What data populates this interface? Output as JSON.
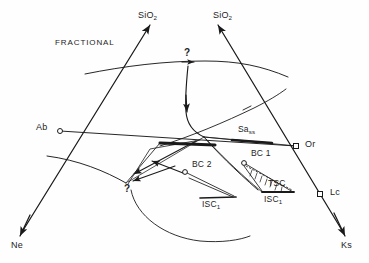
{
  "figure": {
    "type": "petrologic-phase-diagram",
    "mode_label": "FRACTIONAL",
    "ink_color": "#1a1a1a",
    "background": "#ffffff"
  },
  "apex_labels": {
    "sio2_left": "SiO",
    "sio2_left_sub": "2",
    "sio2_right": "SiO",
    "sio2_right_sub": "2",
    "ne": "Ne",
    "ks": "Ks"
  },
  "node_labels": {
    "ab": "Ab",
    "or": "Or",
    "lc": "Lc"
  },
  "field_labels": {
    "sa_ss": "Sa",
    "sa_ss_sub": "ss",
    "bc1": "BC 1",
    "bc2": "BC 2",
    "tsc": "TSC",
    "isc1_left": "ISC",
    "isc1_left_sub": "1",
    "isc1_right": "ISC",
    "isc1_right_sub": "1"
  },
  "query_markers": {
    "top": "?",
    "left": "?"
  },
  "markers": [
    {
      "name": "ab-node",
      "x": 60,
      "y": 131,
      "shape": "circle"
    },
    {
      "name": "or-node",
      "x": 296,
      "y": 146,
      "shape": "square"
    },
    {
      "name": "lc-node",
      "x": 320,
      "y": 194,
      "shape": "square"
    },
    {
      "name": "bc1-node",
      "x": 244,
      "y": 163,
      "shape": "circle"
    },
    {
      "name": "bc2-node",
      "x": 185,
      "y": 172,
      "shape": "circle"
    }
  ]
}
